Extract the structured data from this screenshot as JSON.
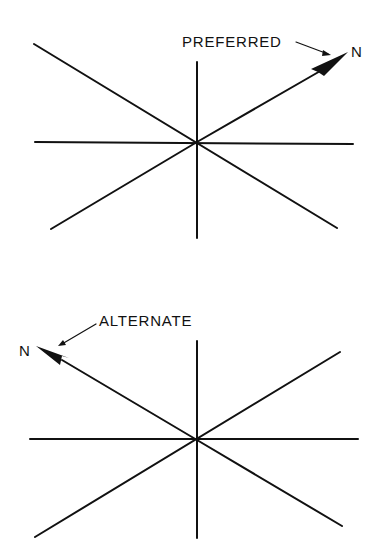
{
  "diagrams": [
    {
      "id": "preferred",
      "label": "PREFERRED",
      "north_label": "N",
      "arrow_direction": "upper-right"
    },
    {
      "id": "alternate",
      "label": "ALTERNATE",
      "north_label": "N",
      "arrow_direction": "upper-left"
    }
  ],
  "colors": {
    "ink": "#111111",
    "background": "#ffffff"
  }
}
